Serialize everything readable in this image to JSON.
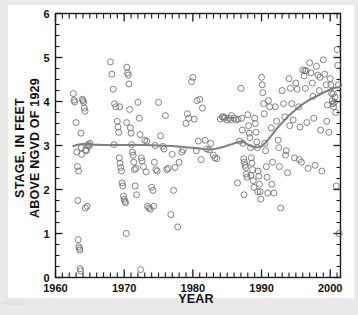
{
  "figure": {
    "background_color": "#e9e9e9",
    "card_color": "#ffffff",
    "axis_color": "#1a1a1a",
    "marker_color": "#6e6e6e",
    "trend_color": "#808080",
    "corner_artifact_text": "m6 1/1/1"
  },
  "chart_data": {
    "type": "scatter",
    "title": "",
    "xlabel": "YEAR",
    "ylabel": "STAGE, IN FEET ABOVE NGVD OF 1929",
    "ylabel_line1": "STAGE, IN FEET",
    "ylabel_line2": "ABOVE NGVD OF 1929",
    "xlim": [
      1960,
      2001.5
    ],
    "ylim": [
      0,
      6
    ],
    "xticks": [
      1960,
      1970,
      1980,
      1990,
      2000
    ],
    "xticklabels": [
      "1960",
      "1970",
      "1980",
      "1990",
      "2000"
    ],
    "xminor_step": 1,
    "yticks": [
      0,
      1,
      2,
      3,
      4,
      5,
      6
    ],
    "yticklabels": [
      "0",
      "1",
      "2",
      "3",
      "4",
      "5",
      "6"
    ],
    "yminor_step": 0.25,
    "grid": false,
    "legend": null,
    "marker": "open-circle",
    "marker_size": 3.0,
    "series": [
      {
        "name": "stage-observations",
        "x": [
          1962.6,
          1962.7,
          1962.8,
          1963.0,
          1963.1,
          1963.2,
          1963.25,
          1963.3,
          1963.4,
          1963.5,
          1963.55,
          1963.6,
          1963.65,
          1963.7,
          1963.75,
          1963.8,
          1963.9,
          1964.0,
          1964.1,
          1964.2,
          1964.3,
          1964.4,
          1964.5,
          1964.6,
          1964.7,
          1964.8,
          1964.9,
          1965.0,
          1968.0,
          1968.2,
          1968.4,
          1968.6,
          1968.8,
          1969.0,
          1969.1,
          1969.2,
          1969.3,
          1969.4,
          1969.5,
          1969.6,
          1969.7,
          1969.8,
          1969.9,
          1970.0,
          1970.1,
          1970.2,
          1970.3,
          1970.4,
          1970.5,
          1970.6,
          1970.7,
          1970.8,
          1970.9,
          1971.0,
          1971.1,
          1971.2,
          1971.3,
          1971.4,
          1971.5,
          1971.6,
          1971.8,
          1972.0,
          1972.2,
          1972.3,
          1972.5,
          1972.6,
          1972.8,
          1973.0,
          1973.2,
          1973.4,
          1973.6,
          1973.8,
          1974.0,
          1974.2,
          1974.4,
          1974.5,
          1974.6,
          1974.8,
          1975.0,
          1975.3,
          1975.6,
          1976.0,
          1976.4,
          1976.8,
          1977.0,
          1977.4,
          1977.8,
          1978.0,
          1978.4,
          1979.0,
          1979.4,
          1979.8,
          1980.0,
          1980.2,
          1980.5,
          1980.8,
          1981.0,
          1981.4,
          1981.8,
          1982.0,
          1982.4,
          1983.0,
          1983.5,
          1984.0,
          1984.3,
          1984.6,
          1985.0,
          1985.3,
          1985.6,
          1986.0,
          1986.3,
          1986.6,
          1986.8,
          1987.0,
          1987.1,
          1987.2,
          1987.3,
          1987.4,
          1987.5,
          1987.6,
          1987.7,
          1987.8,
          1987.9,
          1988.0,
          1988.1,
          1988.2,
          1988.3,
          1988.4,
          1988.5,
          1988.6,
          1988.7,
          1988.8,
          1988.9,
          1989.0,
          1989.1,
          1989.2,
          1989.3,
          1989.4,
          1989.5,
          1989.6,
          1989.7,
          1989.8,
          1989.9,
          1990.0,
          1990.1,
          1990.2,
          1990.3,
          1990.4,
          1990.5,
          1990.6,
          1990.7,
          1990.8,
          1990.9,
          1991.0,
          1991.2,
          1991.4,
          1991.6,
          1991.8,
          1992.0,
          1992.2,
          1992.4,
          1992.6,
          1992.8,
          1993.0,
          1993.2,
          1993.4,
          1993.6,
          1993.8,
          1994.0,
          1994.2,
          1994.4,
          1994.6,
          1994.8,
          1995.0,
          1995.2,
          1995.4,
          1995.6,
          1995.8,
          1996.0,
          1996.2,
          1996.3,
          1996.4,
          1996.6,
          1996.8,
          1997.0,
          1997.2,
          1997.4,
          1997.6,
          1997.8,
          1998.0,
          1998.2,
          1998.4,
          1998.6,
          1998.8,
          1999.0,
          1999.2,
          1999.4,
          1999.6,
          1999.8,
          2000.0,
          2000.1,
          2000.2,
          2000.3,
          2000.4,
          2000.5,
          2000.6,
          2000.7,
          2000.8,
          2000.9,
          2001.0,
          2001.1,
          2001.2,
          2001.3,
          1994.1,
          1995.5,
          1996.5,
          1997.5,
          1998.5,
          1999.5,
          2000.45,
          1991.5,
          1992.5,
          1993.5,
          1989.45,
          1988.45,
          1987.45,
          1986.5,
          1985.5,
          1984.5,
          1983.2,
          1982.6,
          1981.2,
          1980.6,
          1979.2,
          1978.6,
          1977.2,
          1976.2,
          1975.8,
          1974.3,
          1973.3,
          1972.4,
          1971.7,
          1970.35,
          1969.35,
          1968.5,
          1964.35,
          1963.35
        ],
        "y": [
          4.18,
          4.03,
          3.99,
          3.52,
          2.85,
          2.52,
          1.75,
          0.86,
          0.7,
          0.66,
          0.62,
          0.2,
          0.15,
          3.28,
          2.95,
          2.8,
          4.05,
          4.02,
          3.98,
          3.85,
          3.78,
          2.9,
          2.88,
          1.62,
          3.0,
          3.02,
          2.98,
          3.05,
          4.9,
          4.62,
          4.28,
          3.95,
          3.88,
          3.55,
          3.42,
          3.3,
          2.72,
          2.6,
          2.5,
          2.42,
          2.15,
          2.08,
          1.85,
          1.78,
          1.73,
          1.7,
          1.0,
          4.78,
          4.65,
          4.6,
          4.4,
          3.82,
          3.4,
          3.28,
          3.02,
          2.85,
          2.78,
          2.62,
          2.45,
          2.08,
          1.88,
          3.98,
          3.62,
          3.25,
          2.72,
          2.65,
          2.52,
          3.12,
          2.4,
          1.62,
          1.58,
          1.55,
          2.05,
          1.98,
          2.62,
          3.0,
          2.45,
          2.42,
          3.98,
          3.22,
          2.98,
          3.68,
          2.48,
          1.43,
          2.8,
          2.5,
          1.15,
          2.62,
          2.85,
          3.5,
          3.62,
          4.45,
          4.55,
          3.6,
          2.88,
          3.1,
          4.05,
          3.85,
          3.12,
          2.92,
          2.9,
          2.78,
          2.7,
          3.6,
          3.65,
          3.62,
          3.58,
          3.62,
          3.68,
          3.62,
          3.58,
          3.6,
          3.1,
          4.3,
          3.62,
          3.35,
          3.05,
          2.7,
          2.62,
          2.55,
          2.5,
          2.35,
          2.28,
          3.7,
          3.45,
          3.28,
          3.18,
          2.95,
          2.72,
          2.6,
          2.45,
          2.2,
          2.05,
          3.62,
          3.5,
          3.3,
          3.08,
          2.95,
          2.42,
          2.3,
          2.12,
          1.95,
          1.78,
          4.55,
          4.38,
          4.2,
          3.95,
          3.72,
          3.05,
          2.88,
          2.52,
          2.28,
          1.92,
          4.02,
          3.88,
          3.4,
          2.62,
          1.92,
          3.88,
          3.55,
          3.12,
          2.52,
          1.58,
          4.25,
          3.95,
          3.65,
          2.88,
          2.38,
          4.52,
          4.3,
          3.95,
          3.58,
          2.72,
          4.42,
          4.28,
          3.88,
          3.42,
          2.62,
          4.72,
          4.58,
          4.7,
          4.3,
          3.52,
          2.48,
          4.88,
          4.65,
          4.42,
          3.62,
          2.55,
          4.8,
          4.6,
          4.25,
          3.35,
          2.42,
          4.95,
          4.62,
          4.38,
          3.92,
          3.3,
          4.52,
          4.38,
          4.18,
          4.02,
          3.95,
          3.88,
          3.98,
          4.1,
          3.75,
          2.08,
          5.18,
          4.82,
          4.38,
          1.0,
          3.45,
          2.68,
          4.7,
          4.12,
          4.55,
          3.55,
          4.18,
          2.12,
          2.95,
          2.78,
          1.95,
          2.32,
          1.88,
          2.15,
          3.58,
          3.65,
          2.72,
          3.05,
          2.68,
          4.02,
          3.72,
          2.9,
          1.98,
          2.45,
          2.92,
          1.62,
          3.1,
          0.18,
          2.48,
          3.52,
          3.88,
          3.02,
          1.58,
          2.42
        ],
        "marker": "open-circle",
        "color": "#6e6e6e",
        "n_points": 239
      }
    ],
    "trend_line": {
      "name": "smoothed-trend",
      "color": "#808080",
      "linewidth": 2.1,
      "x": [
        1962.6,
        1963.5,
        1964.3,
        1965.5,
        1967.0,
        1969.0,
        1971.0,
        1973.0,
        1975.0,
        1977.0,
        1979.0,
        1980.5,
        1981.5,
        1982.5,
        1983.5,
        1984.5,
        1985.5,
        1986.4,
        1987.0,
        1987.6,
        1988.3,
        1989.0,
        1989.6,
        1990.0,
        1990.5,
        1991.0,
        1991.6,
        1992.2,
        1993.0,
        1994.0,
        1995.0,
        1996.0,
        1997.0,
        1998.0,
        1999.0,
        1999.8,
        2000.4,
        2001.0,
        2001.4
      ],
      "y": [
        2.99,
        3.03,
        3.04,
        3.02,
        3.01,
        3.01,
        3.01,
        3.01,
        3.0,
        2.99,
        2.96,
        2.94,
        2.92,
        2.91,
        2.93,
        2.97,
        3.02,
        3.07,
        3.09,
        3.06,
        3.0,
        2.96,
        2.96,
        2.98,
        3.05,
        3.14,
        3.26,
        3.38,
        3.52,
        3.68,
        3.82,
        3.94,
        4.04,
        4.12,
        4.2,
        4.26,
        4.3,
        4.32,
        4.33
      ]
    }
  }
}
